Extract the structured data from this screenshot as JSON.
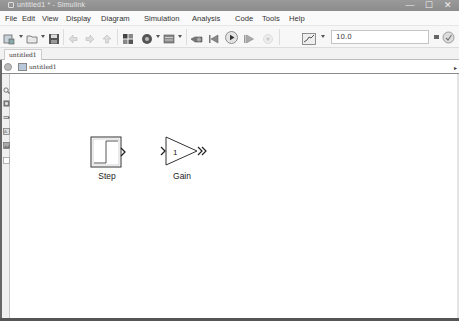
{
  "window": {
    "title": "untitled1 * - Simulink",
    "controls": {
      "minimize": "—",
      "maximize": "☐",
      "close": "✕"
    }
  },
  "menu": {
    "items": [
      "File",
      "Edit",
      "View",
      "Display",
      "Diagram",
      "Simulation",
      "Analysis",
      "Code",
      "Tools",
      "Help"
    ]
  },
  "toolbar": {
    "buttons": [
      {
        "name": "new-model",
        "icon": "new-model-icon",
        "has_dropdown": true
      },
      {
        "name": "open",
        "icon": "folder-icon",
        "has_dropdown": true
      },
      {
        "name": "save",
        "icon": "save-icon"
      },
      {
        "name": "back",
        "icon": "back-arrow-icon",
        "enabled": false
      },
      {
        "name": "forward",
        "icon": "forward-arrow-icon",
        "enabled": false
      },
      {
        "name": "up",
        "icon": "up-arrow-icon",
        "enabled": false
      },
      {
        "name": "library-browser",
        "icon": "library-browser-icon"
      },
      {
        "name": "model-config",
        "icon": "gear-icon",
        "has_dropdown": true
      },
      {
        "name": "model-explorer",
        "icon": "model-explorer-icon",
        "has_dropdown": true
      },
      {
        "name": "update-diagram",
        "icon": "update-diagram-icon"
      },
      {
        "name": "step-back",
        "icon": "step-back-icon"
      },
      {
        "name": "run",
        "icon": "play-icon"
      },
      {
        "name": "step-forward",
        "icon": "step-forward-icon"
      },
      {
        "name": "stop",
        "icon": "stop-icon",
        "enabled": false
      },
      {
        "name": "data-inspector",
        "icon": "data-inspector-icon",
        "has_dropdown": true
      },
      {
        "name": "simulation-mode",
        "icon": "menu-icon"
      },
      {
        "name": "model-advisor",
        "icon": "advisor-icon",
        "has_dropdown": true
      },
      {
        "name": "build",
        "icon": "build-icon"
      }
    ],
    "stop_time": "10.0"
  },
  "tabs": [
    {
      "label": "untitled1"
    }
  ],
  "address_bar": {
    "breadcrumb": "untitled1",
    "dropdown_arrow": "▸"
  },
  "palette": {
    "tools": [
      "zoom-icon",
      "fit-to-view-icon",
      "arrow-icon",
      "annotation-icon",
      "image-icon",
      "area-icon"
    ]
  },
  "canvas": {
    "blocks": [
      {
        "type": "Step",
        "label": "Step"
      },
      {
        "type": "Gain",
        "label": "Gain",
        "value": "1"
      }
    ]
  }
}
